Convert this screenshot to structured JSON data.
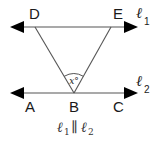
{
  "diagram": {
    "points": {
      "D": "D",
      "E": "E",
      "A": "A",
      "B": "B",
      "C": "C"
    },
    "lines": {
      "l1": {
        "symbol": "ℓ",
        "subscript": "1"
      },
      "l2": {
        "symbol": "ℓ",
        "subscript": "2"
      }
    },
    "angle_label": "x°",
    "caption": {
      "left_symbol": "ℓ",
      "left_sub": "1",
      "relation": "∥",
      "right_symbol": "ℓ",
      "right_sub": "2"
    },
    "colors": {
      "line": "#555555",
      "arrow": "#000000",
      "text": "#1a1a1a"
    }
  }
}
